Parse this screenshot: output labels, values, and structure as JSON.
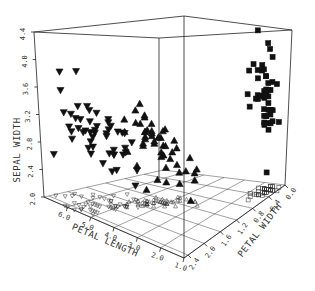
{
  "chart_data": {
    "type": "scatter3d",
    "title": "",
    "axes": {
      "z": {
        "label": "SEPAL WIDTH",
        "ticks": [
          "2.0",
          "2.4",
          "2.8",
          "3.2",
          "3.6",
          "4.0",
          "4.4"
        ],
        "range": [
          2.0,
          4.4
        ]
      },
      "x": {
        "label": "PETAL LENGTH",
        "ticks": [
          "6.0",
          "5.0",
          "4.0",
          "3.0",
          "2.0",
          "1.0"
        ],
        "range": [
          1.0,
          7.0
        ]
      },
      "y": {
        "label": "PETAL WIDTH",
        "ticks": [
          "2.4",
          "2.0",
          "1.6",
          "1.2",
          "0.8",
          "0.4",
          "0.0"
        ],
        "range": [
          0.0,
          2.5
        ]
      }
    },
    "grid": "floor",
    "floor_projection": true,
    "legend": null,
    "series": [
      {
        "name": "setosa",
        "marker": "square",
        "points": [
          [
            1.4,
            0.2,
            3.5
          ],
          [
            1.4,
            0.2,
            3.0
          ],
          [
            1.3,
            0.2,
            3.2
          ],
          [
            1.5,
            0.2,
            3.1
          ],
          [
            1.4,
            0.2,
            3.6
          ],
          [
            1.7,
            0.4,
            3.9
          ],
          [
            1.4,
            0.3,
            3.4
          ],
          [
            1.5,
            0.2,
            3.4
          ],
          [
            1.4,
            0.2,
            2.9
          ],
          [
            1.5,
            0.1,
            3.1
          ],
          [
            1.5,
            0.2,
            3.7
          ],
          [
            1.6,
            0.2,
            3.4
          ],
          [
            1.4,
            0.1,
            3.0
          ],
          [
            1.1,
            0.1,
            3.0
          ],
          [
            1.2,
            0.2,
            4.0
          ],
          [
            1.5,
            0.4,
            4.4
          ],
          [
            1.3,
            0.4,
            3.9
          ],
          [
            1.4,
            0.3,
            3.5
          ],
          [
            1.7,
            0.3,
            3.8
          ],
          [
            1.5,
            0.3,
            3.8
          ],
          [
            1.7,
            0.2,
            3.4
          ],
          [
            1.5,
            0.4,
            3.7
          ],
          [
            1.0,
            0.2,
            3.6
          ],
          [
            1.7,
            0.5,
            3.3
          ],
          [
            1.9,
            0.2,
            3.4
          ],
          [
            1.6,
            0.2,
            3.0
          ],
          [
            1.6,
            0.4,
            3.4
          ],
          [
            1.5,
            0.2,
            3.5
          ],
          [
            1.4,
            0.2,
            3.4
          ],
          [
            1.6,
            0.2,
            3.2
          ],
          [
            1.6,
            0.2,
            3.1
          ],
          [
            1.5,
            0.4,
            3.4
          ],
          [
            1.5,
            0.1,
            4.1
          ],
          [
            1.4,
            0.2,
            4.2
          ],
          [
            1.5,
            0.2,
            3.1
          ],
          [
            1.2,
            0.2,
            3.2
          ],
          [
            1.3,
            0.2,
            3.5
          ],
          [
            1.4,
            0.1,
            3.6
          ],
          [
            1.3,
            0.2,
            3.0
          ],
          [
            1.5,
            0.2,
            3.4
          ],
          [
            1.3,
            0.3,
            3.5
          ],
          [
            1.3,
            0.3,
            2.3
          ],
          [
            1.3,
            0.2,
            3.2
          ],
          [
            1.6,
            0.6,
            3.5
          ],
          [
            1.9,
            0.4,
            3.8
          ],
          [
            1.4,
            0.3,
            3.0
          ],
          [
            1.6,
            0.2,
            3.8
          ],
          [
            1.4,
            0.2,
            3.2
          ],
          [
            1.5,
            0.2,
            3.7
          ],
          [
            1.4,
            0.2,
            3.3
          ]
        ]
      },
      {
        "name": "versicolor",
        "marker": "triangle-up",
        "points": [
          [
            4.7,
            1.4,
            3.2
          ],
          [
            4.5,
            1.5,
            3.2
          ],
          [
            4.9,
            1.5,
            3.1
          ],
          [
            4.0,
            1.3,
            2.3
          ],
          [
            4.6,
            1.5,
            2.8
          ],
          [
            4.5,
            1.3,
            2.8
          ],
          [
            4.7,
            1.6,
            3.3
          ],
          [
            3.3,
            1.0,
            2.4
          ],
          [
            4.6,
            1.3,
            2.9
          ],
          [
            3.9,
            1.4,
            2.7
          ],
          [
            3.5,
            1.0,
            2.0
          ],
          [
            4.2,
            1.5,
            3.0
          ],
          [
            4.0,
            1.0,
            2.2
          ],
          [
            4.7,
            1.4,
            2.9
          ],
          [
            3.6,
            1.3,
            2.9
          ],
          [
            4.4,
            1.4,
            3.1
          ],
          [
            4.5,
            1.5,
            3.0
          ],
          [
            4.1,
            1.0,
            2.7
          ],
          [
            4.5,
            1.5,
            2.2
          ],
          [
            3.9,
            1.1,
            2.5
          ],
          [
            4.8,
            1.8,
            3.2
          ],
          [
            4.0,
            1.3,
            2.8
          ],
          [
            4.9,
            1.5,
            2.5
          ],
          [
            4.7,
            1.2,
            2.8
          ],
          [
            4.3,
            1.3,
            2.9
          ],
          [
            4.4,
            1.4,
            3.0
          ],
          [
            4.8,
            1.4,
            2.8
          ],
          [
            5.0,
            1.7,
            3.0
          ],
          [
            4.5,
            1.5,
            2.9
          ],
          [
            3.5,
            1.0,
            2.6
          ],
          [
            3.8,
            1.1,
            2.4
          ],
          [
            3.7,
            1.0,
            2.4
          ],
          [
            3.9,
            1.2,
            2.7
          ],
          [
            5.1,
            1.6,
            2.7
          ],
          [
            4.5,
            1.5,
            3.0
          ],
          [
            4.5,
            1.6,
            3.4
          ],
          [
            4.7,
            1.5,
            3.1
          ],
          [
            4.4,
            1.3,
            2.3
          ],
          [
            4.1,
            1.3,
            3.0
          ],
          [
            4.0,
            1.3,
            2.5
          ],
          [
            4.4,
            1.2,
            2.6
          ],
          [
            4.6,
            1.4,
            3.0
          ],
          [
            4.0,
            1.2,
            2.6
          ],
          [
            3.3,
            1.0,
            2.3
          ],
          [
            4.2,
            1.3,
            2.7
          ],
          [
            4.2,
            1.2,
            3.0
          ],
          [
            4.2,
            1.3,
            2.9
          ],
          [
            4.3,
            1.3,
            2.9
          ],
          [
            3.0,
            1.1,
            2.5
          ],
          [
            4.1,
            1.3,
            2.8
          ]
        ]
      },
      {
        "name": "virginica",
        "marker": "triangle-down",
        "points": [
          [
            6.0,
            2.5,
            3.3
          ],
          [
            5.1,
            1.9,
            2.7
          ],
          [
            5.9,
            2.1,
            3.0
          ],
          [
            5.6,
            1.8,
            2.9
          ],
          [
            5.8,
            2.2,
            3.0
          ],
          [
            6.6,
            2.1,
            3.0
          ],
          [
            4.5,
            1.7,
            2.5
          ],
          [
            6.3,
            1.8,
            2.9
          ],
          [
            5.8,
            1.8,
            2.5
          ],
          [
            6.1,
            2.5,
            3.6
          ],
          [
            5.1,
            2.0,
            3.2
          ],
          [
            5.3,
            1.9,
            2.7
          ],
          [
            5.5,
            2.1,
            3.0
          ],
          [
            5.0,
            2.0,
            2.5
          ],
          [
            5.1,
            2.4,
            2.8
          ],
          [
            5.3,
            2.3,
            3.2
          ],
          [
            5.5,
            1.8,
            3.0
          ],
          [
            6.7,
            2.2,
            3.8
          ],
          [
            6.9,
            2.3,
            2.6
          ],
          [
            5.0,
            1.5,
            2.2
          ],
          [
            5.7,
            2.3,
            3.2
          ],
          [
            4.9,
            2.0,
            2.8
          ],
          [
            6.7,
            2.0,
            2.8
          ],
          [
            4.9,
            1.8,
            2.7
          ],
          [
            5.7,
            2.1,
            3.3
          ],
          [
            6.0,
            1.8,
            3.2
          ],
          [
            4.8,
            1.8,
            2.8
          ],
          [
            4.9,
            1.8,
            3.0
          ],
          [
            5.6,
            2.1,
            2.8
          ],
          [
            5.8,
            1.6,
            3.0
          ],
          [
            6.1,
            1.9,
            2.8
          ],
          [
            6.4,
            2.0,
            3.8
          ],
          [
            5.6,
            2.2,
            2.8
          ],
          [
            5.1,
            1.5,
            2.8
          ],
          [
            5.6,
            1.4,
            2.6
          ],
          [
            6.1,
            2.3,
            3.0
          ],
          [
            5.6,
            2.4,
            3.4
          ],
          [
            5.5,
            1.8,
            3.1
          ],
          [
            4.8,
            1.8,
            3.0
          ],
          [
            5.4,
            2.1,
            3.1
          ],
          [
            5.6,
            2.4,
            3.1
          ],
          [
            5.1,
            2.3,
            3.1
          ],
          [
            5.1,
            1.9,
            2.7
          ],
          [
            5.9,
            2.3,
            3.2
          ],
          [
            5.7,
            2.5,
            3.3
          ],
          [
            5.2,
            2.3,
            3.0
          ],
          [
            5.0,
            1.9,
            2.5
          ],
          [
            5.2,
            2.0,
            3.0
          ],
          [
            5.4,
            2.3,
            3.4
          ],
          [
            5.1,
            1.8,
            3.0
          ]
        ]
      }
    ]
  }
}
